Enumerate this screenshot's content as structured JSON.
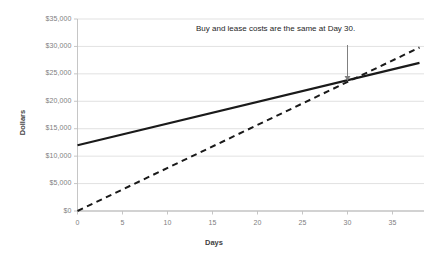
{
  "chart_data": {
    "type": "line",
    "title": "",
    "xlabel": "Days",
    "ylabel": "Dollars",
    "xlim": [
      0,
      38.5
    ],
    "ylim": [
      0,
      35000
    ],
    "grid": true,
    "legend": "none",
    "x_ticks": [
      "0",
      "5",
      "10",
      "15",
      "20",
      "25",
      "30",
      "35"
    ],
    "x_tick_values": [
      0,
      5,
      10,
      15,
      20,
      25,
      30,
      35
    ],
    "y_ticks": [
      "$0",
      "$5,000",
      "$10,000",
      "$15,000",
      "$20,000",
      "$25,000",
      "$30,000",
      "$35,000"
    ],
    "y_tick_values": [
      0,
      5000,
      10000,
      15000,
      20000,
      25000,
      30000,
      35000
    ],
    "series": [
      {
        "name": "Buy",
        "style": "solid",
        "color": "#1a1a1a",
        "x": [
          0,
          38
        ],
        "values": [
          12000,
          27000
        ]
      },
      {
        "name": "Lease",
        "style": "dashed",
        "color": "#1a1a1a",
        "x": [
          0,
          38
        ],
        "values": [
          0,
          29800
        ]
      }
    ],
    "annotations": [
      {
        "text": "Buy and lease costs are the same at Day 30.",
        "pointer": "down-arrow",
        "at_x": 30,
        "at_y": 23500
      }
    ]
  },
  "axis_titles": {
    "y": "Dollars",
    "x": "Days"
  },
  "annotation": {
    "label": "Buy and lease costs are the same at Day 30."
  },
  "colors": {
    "gridline": "#d9d9d9",
    "axis": "#bfbfbf",
    "line": "#1a1a1a",
    "tick_text": "#808080",
    "annotation_text": "#262626"
  }
}
